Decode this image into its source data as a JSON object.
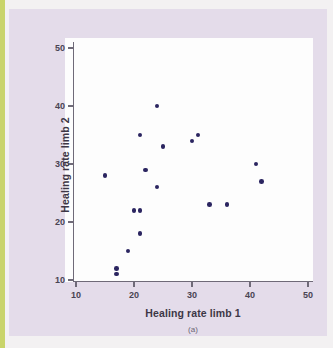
{
  "figure": {
    "caption": "(a)",
    "panel_color": "#e4dcea",
    "plot_background": "#fdfdfd",
    "axis_color": "#6f6a78",
    "edge_strip_color": "#c9d46a"
  },
  "chart_data": {
    "type": "scatter",
    "title": "",
    "xlabel": "Healing rate limb 1",
    "ylabel": "Healing rate limb 2",
    "xlim": [
      8,
      52
    ],
    "ylim": [
      8,
      52
    ],
    "xticks": [
      10,
      20,
      30,
      40,
      50
    ],
    "yticks": [
      10,
      20,
      30,
      40,
      50
    ],
    "xticklabels": [
      "10",
      "20",
      "30",
      "40",
      "50"
    ],
    "yticklabels": [
      "10",
      "20",
      "30",
      "40",
      "50"
    ],
    "grid": false,
    "legend": false,
    "marker_color": "#2b2560",
    "marker_size": 4.6,
    "points": [
      {
        "x": 15,
        "y": 28
      },
      {
        "x": 17,
        "y": 12
      },
      {
        "x": 17,
        "y": 11
      },
      {
        "x": 19,
        "y": 15
      },
      {
        "x": 20,
        "y": 22
      },
      {
        "x": 21,
        "y": 22
      },
      {
        "x": 21,
        "y": 18
      },
      {
        "x": 21,
        "y": 35
      },
      {
        "x": 22,
        "y": 29
      },
      {
        "x": 24,
        "y": 40
      },
      {
        "x": 24,
        "y": 26
      },
      {
        "x": 25,
        "y": 33
      },
      {
        "x": 30,
        "y": 34
      },
      {
        "x": 31,
        "y": 35
      },
      {
        "x": 33,
        "y": 23
      },
      {
        "x": 36,
        "y": 23
      },
      {
        "x": 41,
        "y": 30
      },
      {
        "x": 42,
        "y": 27
      }
    ]
  }
}
